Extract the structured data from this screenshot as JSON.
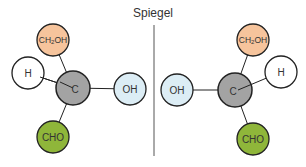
{
  "title": "Spiegel",
  "colors": {
    "ch2oh": "#f6c49c",
    "h": "#ffffff",
    "c": "#a3a3a3",
    "oh": "#dcedf5",
    "cho": "#8fb63a",
    "stroke": "#222222",
    "mirror": "#555555"
  },
  "left_molecule": {
    "center": {
      "label": "C",
      "x": 73,
      "y": 88
    },
    "atoms": [
      {
        "name": "ch2oh",
        "label": "CH2OH",
        "x": 53,
        "y": 40
      },
      {
        "name": "h",
        "label": "H",
        "x": 28,
        "y": 73
      },
      {
        "name": "oh",
        "label": "OH",
        "x": 130,
        "y": 89
      },
      {
        "name": "cho",
        "label": "CHO",
        "x": 53,
        "y": 137
      }
    ]
  },
  "right_molecule": {
    "center": {
      "label": "C",
      "x": 235,
      "y": 90
    },
    "atoms": [
      {
        "name": "ch2oh",
        "label": "CH2OH",
        "x": 253,
        "y": 40
      },
      {
        "name": "h",
        "label": "H",
        "x": 281,
        "y": 72
      },
      {
        "name": "oh",
        "label": "OH",
        "x": 177,
        "y": 90
      },
      {
        "name": "cho",
        "label": "CHO",
        "x": 253,
        "y": 139
      }
    ]
  },
  "labels": {
    "ch2oh_main": "CH",
    "ch2oh_sub": "2",
    "ch2oh_tail": "OH",
    "h": "H",
    "c": "C",
    "oh": "OH",
    "cho": "CHO"
  }
}
